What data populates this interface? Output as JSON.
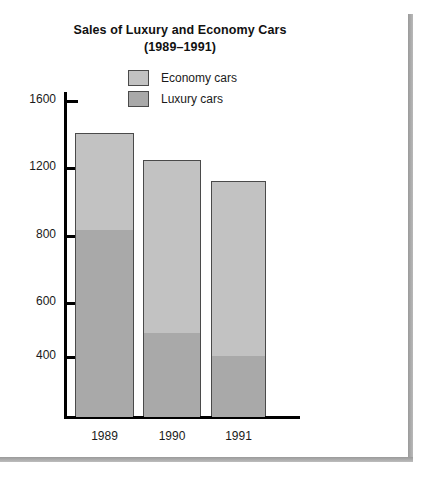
{
  "figure": {
    "title_line1": "Sales of Luxury and Economy Cars",
    "title_line2": "(1989–1991)"
  },
  "legend": {
    "position": "top-center",
    "items": [
      {
        "label": "Economy cars",
        "color": "#c2c2c2",
        "swatch_name": "economy-cars-swatch"
      },
      {
        "label": "Luxury cars",
        "color": "#a9a9a9",
        "swatch_name": "luxury-cars-swatch"
      }
    ]
  },
  "axes": {
    "y_tick_labels": [
      "1600",
      "1200",
      "800",
      "600",
      "400"
    ],
    "x_tick_labels": [
      "1989",
      "1990",
      "1991"
    ]
  },
  "chart_data": {
    "type": "bar",
    "subtype": "stacked-vertical",
    "title": "Sales of Luxury and Economy Cars (1989–1991)",
    "xlabel": "",
    "ylabel": "",
    "categories": [
      "1989",
      "1990",
      "1991"
    ],
    "series": [
      {
        "name": "Luxury cars",
        "color": "#a9a9a9",
        "values": [
          800,
          475,
          410
        ]
      },
      {
        "name": "Economy cars",
        "color": "#c2c2c2",
        "values": [
          600,
          735,
          690
        ]
      }
    ],
    "totals": [
      1400,
      1210,
      1100
    ],
    "ytick_values": [
      1600,
      1200,
      800,
      600,
      400
    ],
    "ylim": [
      0,
      1700
    ],
    "grid": false,
    "legend_position": "top-center",
    "note": "Y axis tick spacing as drawn is irregular between 1600 and 800."
  },
  "render": {
    "y_tick_pixels": [
      100,
      167,
      235,
      302,
      356
    ],
    "baseline_pixel": 416,
    "bars": [
      {
        "category": "1989",
        "left": 75,
        "width": 59,
        "top": 133,
        "split": 229
      },
      {
        "category": "1990",
        "left": 143,
        "width": 58,
        "top": 160,
        "split": 332
      },
      {
        "category": "1991",
        "left": 211,
        "width": 55,
        "top": 181,
        "split": 355
      }
    ]
  }
}
